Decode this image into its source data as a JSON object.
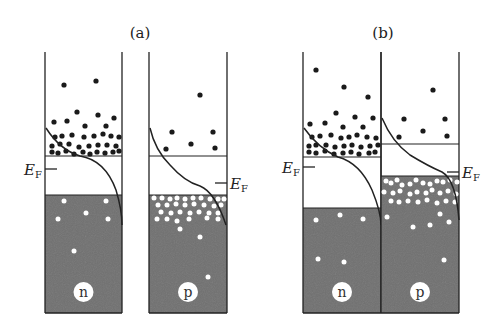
{
  "figure": {
    "panels": [
      {
        "id": "a",
        "title": "(a)",
        "title_x": 140,
        "blocks": [
          {
            "type": "n",
            "label": "n",
            "x": 45,
            "w": 77,
            "cb_line_y": 156,
            "vb_top_y": 195,
            "ef_y": 169,
            "ef_side": "left",
            "electrons": [
              [
                64,
                85
              ],
              [
                96,
                81
              ],
              [
                54,
                122
              ],
              [
                67,
                121
              ],
              [
                77,
                112
              ],
              [
                98,
                115
              ],
              [
                85,
                126
              ],
              [
                114,
                118
              ],
              [
                106,
                126
              ],
              [
                55,
                137
              ],
              [
                62,
                136
              ],
              [
                72,
                135
              ],
              [
                84,
                137
              ],
              [
                94,
                136
              ],
              [
                103,
                134
              ],
              [
                111,
                136
              ],
              [
                119,
                137
              ],
              [
                52,
                146
              ],
              [
                60,
                144
              ],
              [
                69,
                144
              ],
              [
                79,
                147
              ],
              [
                89,
                146
              ],
              [
                98,
                145
              ],
              [
                107,
                145
              ],
              [
                116,
                146
              ],
              [
                52,
                152
              ],
              [
                58,
                153
              ],
              [
                66,
                151
              ],
              [
                74,
                154
              ],
              [
                83,
                152
              ],
              [
                90,
                154
              ],
              [
                97,
                152
              ],
              [
                105,
                153
              ],
              [
                113,
                152
              ],
              [
                119,
                151
              ]
            ],
            "holes": [
              [
                64,
                201
              ],
              [
                106,
                201
              ],
              [
                86,
                213
              ],
              [
                58,
                219
              ],
              [
                108,
                219
              ],
              [
                74,
                251
              ]
            ],
            "curve": "M 46 128 Q 60 150 80 156 Q 105 160 116 190 Q 122 210 122 225"
          },
          {
            "type": "p",
            "label": "p",
            "x": 149,
            "w": 78,
            "cb_line_y": 156,
            "vb_top_y": 195,
            "ef_y": 183,
            "ef_side": "right",
            "electrons": [
              [
                200,
                95
              ],
              [
                172,
                132
              ],
              [
                213,
                132
              ],
              [
                166,
                149
              ],
              [
                191,
                144
              ],
              [
                215,
                148
              ]
            ],
            "holes": [
              [
                154,
                198
              ],
              [
                162,
                198
              ],
              [
                170,
                199
              ],
              [
                177,
                198
              ],
              [
                185,
                199
              ],
              [
                193,
                198
              ],
              [
                201,
                198
              ],
              [
                210,
                199
              ],
              [
                218,
                199
              ],
              [
                224,
                199
              ],
              [
                158,
                205
              ],
              [
                167,
                205
              ],
              [
                176,
                204
              ],
              [
                185,
                205
              ],
              [
                194,
                204
              ],
              [
                204,
                205
              ],
              [
                214,
                206
              ],
              [
                221,
                205
              ],
              [
                161,
                212
              ],
              [
                171,
                213
              ],
              [
                180,
                212
              ],
              [
                190,
                213
              ],
              [
                199,
                212
              ],
              [
                209,
                213
              ],
              [
                218,
                213
              ],
              [
                157,
                219
              ],
              [
                167,
                219
              ],
              [
                177,
                221
              ],
              [
                189,
                219
              ],
              [
                207,
                218
              ],
              [
                218,
                219
              ],
              [
                180,
                229
              ],
              [
                200,
                237
              ],
              [
                208,
                277
              ]
            ],
            "curve": "M 150 128 Q 155 150 170 165 Q 185 182 200 186 Q 215 192 226 225"
          }
        ]
      },
      {
        "id": "b",
        "title": "(b)",
        "title_x": 383,
        "blocks": [
          {
            "type": "n",
            "label": "n",
            "x": 303,
            "w": 78,
            "cb_line_y": 157,
            "vb_top_y": 208,
            "ef_y": 167,
            "ef_side": "left",
            "electrons": [
              [
                316,
                70
              ],
              [
                344,
                87
              ],
              [
                368,
                97
              ],
              [
                310,
                124
              ],
              [
                325,
                123
              ],
              [
                336,
                113
              ],
              [
                355,
                117
              ],
              [
                343,
                127
              ],
              [
                363,
                127
              ],
              [
                373,
                118
              ],
              [
                312,
                137
              ],
              [
                320,
                136
              ],
              [
                331,
                135
              ],
              [
                341,
                138
              ],
              [
                349,
                137
              ],
              [
                357,
                135
              ],
              [
                367,
                137
              ],
              [
                376,
                138
              ],
              [
                309,
                146
              ],
              [
                316,
                145
              ],
              [
                326,
                145
              ],
              [
                335,
                147
              ],
              [
                344,
                146
              ],
              [
                352,
                145
              ],
              [
                361,
                147
              ],
              [
                370,
                146
              ],
              [
                378,
                145
              ],
              [
                309,
                152
              ],
              [
                316,
                153
              ],
              [
                325,
                151
              ],
              [
                334,
                154
              ],
              [
                343,
                153
              ],
              [
                351,
                152
              ],
              [
                359,
                154
              ],
              [
                369,
                153
              ],
              [
                375,
                152
              ]
            ],
            "holes": [
              [
                316,
                220
              ],
              [
                340,
                215
              ],
              [
                363,
                219
              ],
              [
                318,
                259
              ],
              [
                344,
                262
              ]
            ],
            "curve": "M 304 128 Q 318 148 338 157 Q 360 163 372 190 Q 381 212 381 225"
          },
          {
            "type": "p",
            "label": "p",
            "x": 381,
            "w": 78,
            "cb_line_y": 144,
            "vb_top_y": 176,
            "ef_y": 172,
            "ef_side": "right",
            "electrons": [
              [
                433,
                90
              ],
              [
                404,
                119
              ],
              [
                445,
                119
              ],
              [
                399,
                137
              ],
              [
                423,
                131
              ],
              [
                447,
                136
              ]
            ],
            "holes": [
              [
                386,
                181
              ],
              [
                391,
                183
              ],
              [
                397,
                180
              ],
              [
                402,
                185
              ],
              [
                410,
                184
              ],
              [
                416,
                180
              ],
              [
                423,
                183
              ],
              [
                430,
                184
              ],
              [
                437,
                181
              ],
              [
                443,
                182
              ],
              [
                450,
                180
              ],
              [
                457,
                182
              ],
              [
                384,
                192
              ],
              [
                393,
                193
              ],
              [
                400,
                191
              ],
              [
                410,
                194
              ],
              [
                417,
                192
              ],
              [
                426,
                193
              ],
              [
                432,
                190
              ],
              [
                440,
                193
              ],
              [
                448,
                191
              ],
              [
                456,
                194
              ],
              [
                391,
                201
              ],
              [
                399,
                202
              ],
              [
                408,
                201
              ],
              [
                418,
                202
              ],
              [
                427,
                200
              ],
              [
                437,
                203
              ],
              [
                446,
                201
              ],
              [
                455,
                202
              ],
              [
                387,
                217
              ],
              [
                413,
                227
              ],
              [
                430,
                225
              ],
              [
                440,
                214
              ],
              [
                449,
                222
              ],
              [
                444,
                260
              ]
            ],
            "curve": "M 382 118 Q 392 142 410 155 Q 428 166 442 172 Q 456 180 459 220"
          }
        ]
      }
    ],
    "ef_label_main": "E",
    "ef_label_sub": "F",
    "colors": {
      "valence_fill": "#707070",
      "line": "#222222",
      "electron": "#1a1a1a",
      "hole": "#ffffff",
      "label_circle": "#ffffff"
    },
    "layout": {
      "top_y": 52,
      "bottom_y": 313,
      "label_y": 292
    }
  }
}
